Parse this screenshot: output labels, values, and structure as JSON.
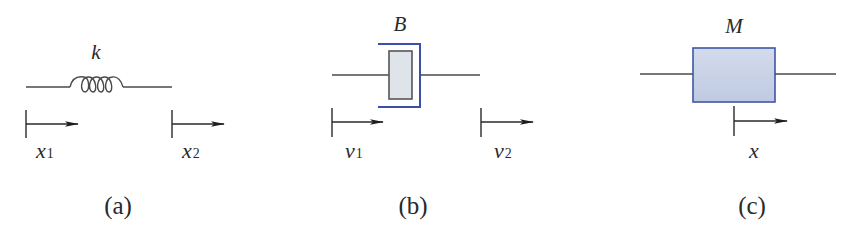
{
  "colors": {
    "line": "#4a4a4a",
    "arrow": "#1e1e1e",
    "damper_bracket": "#3b4fa8",
    "damper_piston_fill": "#dfe3ea",
    "damper_piston_stroke": "#555555",
    "mass_fill": "#c8d2e6",
    "mass_stroke": "#3f57a3"
  },
  "panels": [
    {
      "id": "a",
      "element": "spring",
      "parameter_label": "k",
      "caption": "(a)",
      "arrows": [
        {
          "var": "x",
          "sub": "1"
        },
        {
          "var": "x",
          "sub": "2"
        }
      ]
    },
    {
      "id": "b",
      "element": "damper",
      "parameter_label": "B",
      "caption": "(b)",
      "arrows": [
        {
          "var": "v",
          "sub": "1"
        },
        {
          "var": "v",
          "sub": "2"
        }
      ]
    },
    {
      "id": "c",
      "element": "mass",
      "parameter_label": "M",
      "caption": "(c)",
      "arrows": [
        {
          "var": "x",
          "sub": ""
        }
      ]
    }
  ]
}
